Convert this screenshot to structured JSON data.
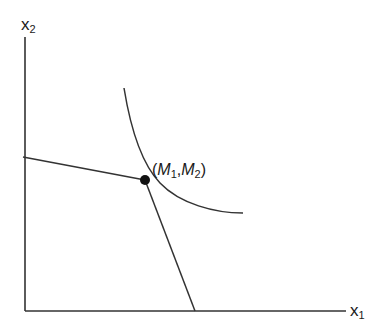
{
  "diagram": {
    "type": "economics-indifference-curve",
    "axes": {
      "x_label": {
        "base": "x",
        "sub": "1"
      },
      "y_label": {
        "base": "x",
        "sub": "2"
      }
    },
    "point_label": {
      "open": "(",
      "m1": "M",
      "m1_sub": "1",
      "comma": ",",
      "m2": "M",
      "m2_sub": "2",
      "close": ")"
    },
    "colors": {
      "line": "#333333",
      "point": "#111111",
      "background": "#ffffff"
    }
  }
}
